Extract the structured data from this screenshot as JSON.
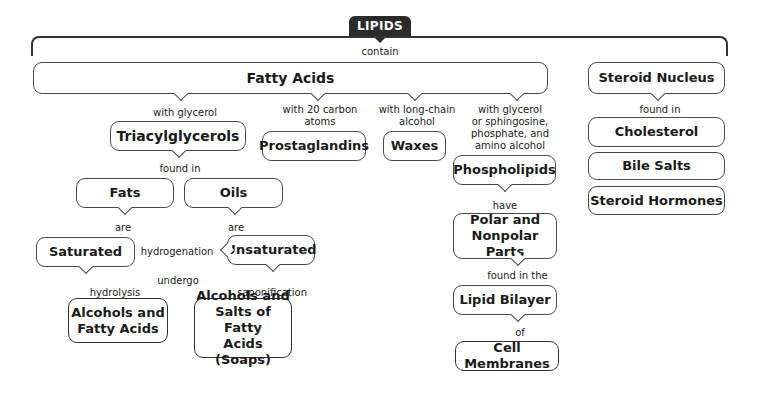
{
  "title": "LIPIDS",
  "connectors": {
    "contain": "contain",
    "with_glycerol": "with glycerol",
    "with_20_carbon": "with 20 carbon\natoms",
    "with_long_chain": "with long-chain\nalcohol",
    "with_glycerol_sphingosine": "with glycerol\nor sphingosine,\nphosphate, and\namino alcohol",
    "found_in_steroid": "found in",
    "found_in_tag": "found in",
    "are_fats": "are",
    "are_oils": "are",
    "hydrogenation": "hydrogenation",
    "undergo": "undergo",
    "hydrolysis": "hydrolysis",
    "saponification": "saponification",
    "have": "have",
    "found_in_the": "found in the",
    "of": "of"
  },
  "nodes": {
    "fatty_acids": "Fatty Acids",
    "steroid_nucleus": "Steroid Nucleus",
    "triacylglycerols": "Triacylglycerols",
    "prostaglandins": "Prostaglandins",
    "waxes": "Waxes",
    "phospholipids": "Phospholipids",
    "cholesterol": "Cholesterol",
    "bile_salts": "Bile Salts",
    "steroid_hormones": "Steroid Hormones",
    "fats": "Fats",
    "oils": "Oils",
    "saturated": "Saturated",
    "unsaturated": "Unsaturated",
    "alcohols_fatty_acids": "Alcohols and\nFatty Acids",
    "alcohols_salts": "Alcohols and\nSalts of Fatty\nAcids (Soaps)",
    "polar_nonpolar": "Polar and\nNonpolar Parts",
    "lipid_bilayer": "Lipid Bilayer",
    "cell_membranes": "Cell Membranes"
  }
}
